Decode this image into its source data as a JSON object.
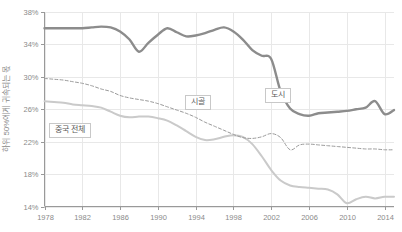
{
  "chart_data": {
    "type": "line",
    "title": "",
    "xlabel": "",
    "ylabel": "하위 50%에게 귀속되는 몫",
    "xlim": [
      1978,
      2015
    ],
    "ylim": [
      14,
      38
    ],
    "ytick_labels": [
      "38%",
      "34%",
      "30%",
      "26%",
      "22%",
      "18%",
      "14%"
    ],
    "ytick_values": [
      38,
      34,
      30,
      26,
      22,
      18,
      14
    ],
    "xtick_labels": [
      "1978",
      "1982",
      "1986",
      "1990",
      "1994",
      "1998",
      "2002",
      "2006",
      "2010",
      "2014"
    ],
    "xtick_values": [
      1978,
      1982,
      1986,
      1990,
      1994,
      1998,
      2002,
      2006,
      2010,
      2014
    ],
    "grid": true,
    "legend_position": "inline-annotations",
    "x": [
      1978,
      1979,
      1980,
      1981,
      1982,
      1983,
      1984,
      1985,
      1986,
      1987,
      1988,
      1989,
      1990,
      1991,
      1992,
      1993,
      1994,
      1995,
      1996,
      1997,
      1998,
      1999,
      2000,
      2001,
      2002,
      2003,
      2004,
      2005,
      2006,
      2007,
      2008,
      2009,
      2010,
      2011,
      2012,
      2013,
      2014,
      2015
    ],
    "series": [
      {
        "name": "도시",
        "style": "solid-thick",
        "color": "#8c8c8c",
        "values": [
          36.0,
          36.0,
          36.0,
          36.0,
          36.0,
          36.1,
          36.2,
          36.1,
          35.6,
          34.6,
          33.1,
          34.2,
          35.2,
          36.0,
          35.5,
          35.0,
          35.1,
          35.4,
          35.8,
          36.1,
          35.6,
          34.6,
          33.3,
          32.6,
          32.2,
          28.2,
          26.1,
          25.4,
          25.2,
          25.5,
          25.6,
          25.7,
          25.8,
          26.0,
          26.2,
          27.0,
          25.4,
          25.9
        ]
      },
      {
        "name": "중국 전체",
        "style": "dashed",
        "color": "#9a9a9a",
        "values": [
          29.8,
          29.7,
          29.6,
          29.4,
          29.2,
          28.9,
          28.5,
          28.2,
          27.7,
          27.4,
          27.2,
          27.0,
          26.7,
          26.3,
          25.9,
          25.5,
          25.0,
          24.4,
          23.9,
          23.4,
          22.9,
          22.5,
          22.4,
          22.6,
          23.0,
          22.5,
          21.0,
          21.6,
          21.7,
          21.6,
          21.5,
          21.4,
          21.3,
          21.2,
          21.1,
          21.1,
          21.0,
          21.0
        ]
      },
      {
        "name": "시골",
        "style": "solid-light",
        "color": "#cacaca",
        "values": [
          27.0,
          26.9,
          26.8,
          26.6,
          26.5,
          26.4,
          26.2,
          25.7,
          25.2,
          25.0,
          25.1,
          25.1,
          24.9,
          24.6,
          24.0,
          23.3,
          22.6,
          22.2,
          22.3,
          22.6,
          22.8,
          22.6,
          21.7,
          20.2,
          18.5,
          17.2,
          16.6,
          16.4,
          16.3,
          16.2,
          16.1,
          15.5,
          14.4,
          14.9,
          15.2,
          15.0,
          15.2,
          15.2
        ]
      }
    ],
    "annotations": [
      {
        "text": "중국 전체",
        "x_px": 49,
        "y_px": 123
      },
      {
        "text": "시골",
        "x_px": 185,
        "y_px": 95
      },
      {
        "text": "도시",
        "x_px": 265,
        "y_px": 88
      }
    ],
    "colors": {
      "urban_line": "#8c8c8c",
      "total_line": "#9a9a9a",
      "rural_line": "#cacaca",
      "grid": "#e8e8e8",
      "axis": "#999999",
      "tick_text": "#8a8a8a"
    }
  }
}
